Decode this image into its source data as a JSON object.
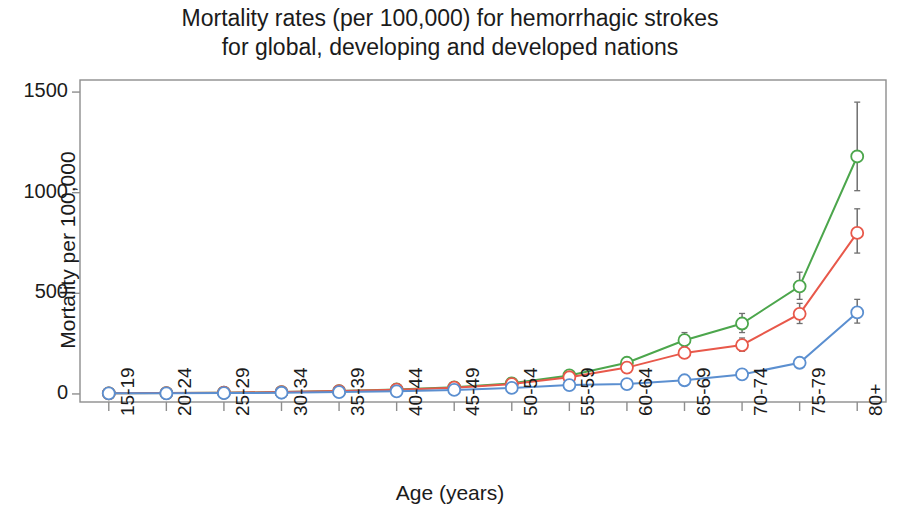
{
  "chart_data": {
    "type": "line",
    "title": "Mortality rates (per 100,000) for hemorrhagic strokes\nfor global, developing and developed nations",
    "xlabel": "Age (years)",
    "ylabel": "Mortality per 100,000",
    "categories": [
      "15-19",
      "20-24",
      "25-29",
      "30-34",
      "35-39",
      "40-44",
      "45-49",
      "50-54",
      "55-59",
      "60-64",
      "65-69",
      "70-74",
      "75-79",
      "80+"
    ],
    "ylim": [
      -40,
      1560
    ],
    "yticks": [
      0,
      500,
      1000,
      1500
    ],
    "ytick_labels": [
      "0",
      "500",
      "1000",
      "1500"
    ],
    "grid": false,
    "legend": "none",
    "marker": "open-circle",
    "error_bars": true,
    "series": [
      {
        "name": "developing",
        "color": "#4ca64c",
        "values": [
          3,
          4,
          6,
          9,
          14,
          22,
          33,
          53,
          92,
          155,
          267,
          350,
          535,
          1180
        ],
        "err_low": [
          2,
          3,
          5,
          7,
          11,
          18,
          27,
          44,
          78,
          133,
          231,
          305,
          470,
          1010
        ],
        "err_high": [
          5,
          6,
          8,
          12,
          18,
          27,
          40,
          64,
          109,
          180,
          305,
          400,
          605,
          1450
        ]
      },
      {
        "name": "global",
        "color": "#e8584a",
        "values": [
          3,
          4,
          6,
          9,
          14,
          21,
          31,
          49,
          83,
          131,
          204,
          243,
          398,
          800
        ],
        "err_low": [
          2,
          3,
          5,
          7,
          11,
          17,
          26,
          41,
          71,
          113,
          178,
          212,
          350,
          700
        ],
        "err_high": [
          5,
          6,
          8,
          12,
          18,
          26,
          38,
          59,
          97,
          152,
          234,
          278,
          450,
          920
        ]
      },
      {
        "name": "developed",
        "color": "#5b8fd0",
        "values": [
          3,
          3,
          4,
          6,
          9,
          13,
          20,
          30,
          44,
          49,
          68,
          97,
          155,
          405
        ],
        "err_low": [
          2,
          2,
          3,
          5,
          7,
          11,
          17,
          25,
          38,
          42,
          59,
          84,
          135,
          352
        ],
        "err_high": [
          4,
          5,
          6,
          8,
          12,
          16,
          24,
          36,
          52,
          58,
          80,
          113,
          180,
          470
        ]
      }
    ]
  }
}
